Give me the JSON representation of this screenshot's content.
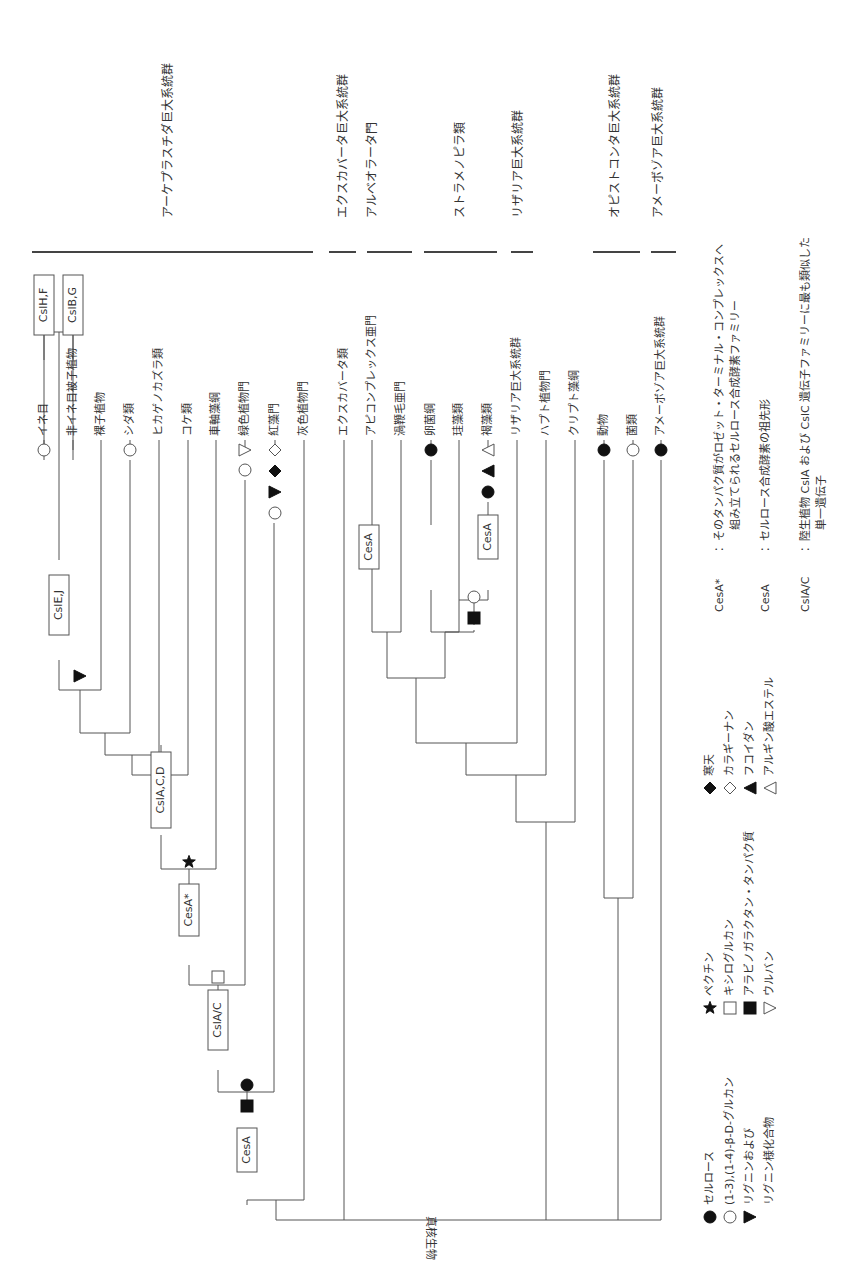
{
  "root_label": "真核生物",
  "colors": {
    "line": "#555555",
    "text": "#333333",
    "fill": "#111111"
  },
  "supergroups": [
    {
      "label": "アーケプラスチダ巨大系統群",
      "x1": 32,
      "x2": 313,
      "tx": 168,
      "ty": 218
    },
    {
      "label": "エクスカバータ巨大系統群",
      "x1": 329,
      "x2": 356,
      "tx": 343,
      "ty": 218
    },
    {
      "label": "アルベオラータ門",
      "x1": 367,
      "x2": 412,
      "tx": 372,
      "ty": 218
    },
    {
      "label": "ストラメノピラ類",
      "x1": 424,
      "x2": 497,
      "tx": 460,
      "ty": 218
    },
    {
      "label": "リザリア巨大系統群",
      "x1": 511,
      "x2": 533,
      "tx": 518,
      "ty": 218
    },
    {
      "label": "オピストコンタ巨大系統群",
      "x1": 593,
      "x2": 640,
      "tx": 615,
      "ty": 218
    },
    {
      "label": "アメーボゾア巨大系統群",
      "x1": 651,
      "x2": 676,
      "tx": 658,
      "ty": 218
    }
  ],
  "leaves": [
    {
      "label": "イネ目",
      "x": 44
    },
    {
      "label": "非イネ目被子植物",
      "x": 73
    },
    {
      "label": "裸子植物",
      "x": 101
    },
    {
      "label": "シダ類",
      "x": 130
    },
    {
      "label": "ヒカゲノカズラ類",
      "x": 159
    },
    {
      "label": "コケ類",
      "x": 188
    },
    {
      "label": "車軸藻綱",
      "x": 216
    },
    {
      "label": "緑色植物門",
      "x": 245
    },
    {
      "label": "紅藻門",
      "x": 275
    },
    {
      "label": "灰色植物門",
      "x": 304
    },
    {
      "label": "エクスカバータ類",
      "x": 344
    },
    {
      "label": "アピコンプレックス亜門",
      "x": 372
    },
    {
      "label": "渦鞭毛亜門",
      "x": 401
    },
    {
      "label": "卵菌綱",
      "x": 431
    },
    {
      "label": "珪藻類",
      "x": 459
    },
    {
      "label": "褐藻類",
      "x": 488
    },
    {
      "label": "リザリア巨大系統群",
      "x": 517
    },
    {
      "label": "ハプト植物門",
      "x": 546
    },
    {
      "label": "クリプト藻綱",
      "x": 575
    },
    {
      "label": "動物",
      "x": 604
    },
    {
      "label": "菌類",
      "x": 633
    },
    {
      "label": "アメーボゾア巨大系統群",
      "x": 661
    }
  ],
  "gene_boxes": [
    {
      "label": "CslH,F",
      "x": 44,
      "y": 305
    },
    {
      "label": "CslB,G",
      "x": 73,
      "y": 305
    },
    {
      "label": "CslE,J",
      "x": 59,
      "y": 605
    },
    {
      "label": "CslA,C,D",
      "x": 161,
      "y": 790
    },
    {
      "label": "CesA*",
      "x": 189,
      "y": 910
    },
    {
      "label": "CslA/C",
      "x": 218,
      "y": 1020
    },
    {
      "label": "CesA",
      "x": 247,
      "y": 1150
    },
    {
      "label": "CesA",
      "x": 369,
      "y": 547
    },
    {
      "label": "CesA",
      "x": 488,
      "y": 537
    }
  ],
  "markers": [
    {
      "type": "circle-open",
      "x": 44,
      "y": 450
    },
    {
      "type": "circle-open",
      "x": 130,
      "y": 450
    },
    {
      "type": "triangle-down-open",
      "x": 245,
      "y": 450
    },
    {
      "type": "circle-open",
      "x": 245,
      "y": 470
    },
    {
      "type": "diamond-open",
      "x": 275,
      "y": 450
    },
    {
      "type": "diamond-filled",
      "x": 275,
      "y": 471
    },
    {
      "type": "triangle-right-filled",
      "x": 275,
      "y": 492
    },
    {
      "type": "circle-open",
      "x": 275,
      "y": 513
    },
    {
      "type": "triangle-right-filled",
      "x": 80,
      "y": 676
    },
    {
      "type": "star-filled",
      "x": 189,
      "y": 862
    },
    {
      "type": "square-open",
      "x": 218,
      "y": 977
    },
    {
      "type": "circle-filled",
      "x": 247,
      "y": 1085
    },
    {
      "type": "square-filled",
      "x": 247,
      "y": 1106
    },
    {
      "type": "circle-filled",
      "x": 431,
      "y": 450
    },
    {
      "type": "circle-filled",
      "x": 488,
      "y": 492
    },
    {
      "type": "triangle-up-filled",
      "x": 488,
      "y": 471
    },
    {
      "type": "triangle-up-open",
      "x": 488,
      "y": 450
    },
    {
      "type": "circle-open",
      "x": 474,
      "y": 597
    },
    {
      "type": "square-filled",
      "x": 474,
      "y": 618
    },
    {
      "type": "circle-filled",
      "x": 604,
      "y": 450
    },
    {
      "type": "circle-open",
      "x": 633,
      "y": 450
    },
    {
      "type": "circle-filled",
      "x": 661,
      "y": 450
    }
  ],
  "tree_paths": [
    "M44 460 V305 M73 460 V305",
    "M44 360 V330 M73 360 V330",
    "M44 330 V330 M44 332 H73",
    "M59 332 V560",
    "M59 660 V690 H101 V450",
    "M80 690 V733 H130 V460",
    "M105 733 V755 H159 V450",
    "M132 755 V775 H188 V450",
    "M161 775 V745",
    "M161 835 V869 H216 V450",
    "M189 869 V885",
    "M189 965 V985 H245 V480",
    "M218 985 V1000",
    "M218 1070 V1092 H274 V523",
    "M247 1092 V1100",
    "M247 1205 V1200 H304 V450",
    "M276 1200 V1220 H641",
    "M344 450 V1220",
    "M372 450 V632 H401 V450",
    "M431 460 V525",
    "M431 590 V632 H459 V450",
    "M488 502 V515",
    "M488 590 V600 H459",
    "M474 600 V625",
    "M474 632 V630 M445 632 H474",
    "M387 632 V678 H445 V632",
    "M416 678 V743 H517 V450",
    "M466 743 V775 H546 V450",
    "M516 775 V822 H575 V450",
    "M604 460 V898 H633 V460",
    "M618 898 V1220",
    "M546 822 V1220",
    "M661 460 V1220 H641"
  ],
  "legend": {
    "col1": [
      {
        "symbol": "circle-filled",
        "label": "セルロース"
      },
      {
        "symbol": "circle-open",
        "label": "(1-3),(1-4)-β-D-グルカン"
      },
      {
        "symbol": "triangle-right-filled",
        "label": "リグニンおよび"
      },
      {
        "symbol": "none",
        "label": "リグニン様化合物"
      }
    ],
    "col2": [
      {
        "symbol": "star-filled",
        "label": "ペクチン"
      },
      {
        "symbol": "square-open",
        "label": "キシログルカン"
      },
      {
        "symbol": "square-filled",
        "label": "アラビノガラクタン・タンパク質"
      },
      {
        "symbol": "triangle-down-open",
        "label": "ウルバン"
      }
    ],
    "col3": [
      {
        "symbol": "diamond-filled",
        "label": "寒天"
      },
      {
        "symbol": "diamond-open",
        "label": "カラギーナン"
      },
      {
        "symbol": "triangle-up-filled",
        "label": "フコイダン"
      },
      {
        "symbol": "triangle-up-open",
        "label": "アルギン酸エステル"
      }
    ],
    "definitions": [
      {
        "term": "CesA*",
        "text": "：そのタンパク質がロゼット・ターミナル・コンプレックスへ",
        "text2": "組み立てられるセルロース合成酵素ファミリー"
      },
      {
        "term": "CesA",
        "text": "：セルロース合成酵素の祖先形",
        "text2": ""
      },
      {
        "term": "CslA/C",
        "text": "：陸生植物 CslA および CslC 遺伝子ファミリーに最も類似した",
        "text2": "単一遺伝子"
      }
    ]
  }
}
